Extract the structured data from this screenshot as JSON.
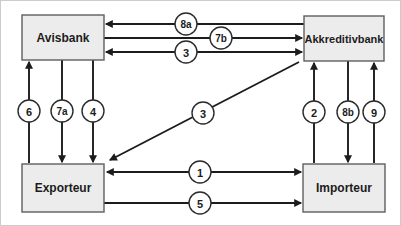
{
  "diagram": {
    "nodes": {
      "avisbank": {
        "label": "Avisbank"
      },
      "akkreditivbank": {
        "label": "Akkreditivbank"
      },
      "exporteur": {
        "label": "Exporteur"
      },
      "importeur": {
        "label": "Importeur"
      }
    },
    "edges": {
      "e8a": {
        "label": "8a",
        "from": "Akkreditivbank",
        "to": "Avisbank",
        "bidirectional": false
      },
      "e7b": {
        "label": "7b",
        "from": "Avisbank",
        "to": "Akkreditivbank",
        "bidirectional": false
      },
      "e3h": {
        "label": "3",
        "from": "Akkreditivbank",
        "to": "Avisbank",
        "bidirectional": true
      },
      "e6": {
        "label": "6",
        "from": "Exporteur",
        "to": "Avisbank",
        "bidirectional": false
      },
      "e7a": {
        "label": "7a",
        "from": "Avisbank",
        "to": "Exporteur",
        "bidirectional": false
      },
      "e4": {
        "label": "4",
        "from": "Avisbank",
        "to": "Exporteur",
        "bidirectional": false
      },
      "e3d": {
        "label": "3",
        "from": "Akkreditivbank",
        "to": "Exporteur",
        "bidirectional": false
      },
      "e2": {
        "label": "2",
        "from": "Importeur",
        "to": "Akkreditivbank",
        "bidirectional": false
      },
      "e8b": {
        "label": "8b",
        "from": "Akkreditivbank",
        "to": "Importeur",
        "bidirectional": false
      },
      "e9": {
        "label": "9",
        "from": "Importeur",
        "to": "Akkreditivbank",
        "bidirectional": false
      },
      "e1": {
        "label": "1",
        "from": "Exporteur",
        "to": "Importeur",
        "bidirectional": true
      },
      "e5": {
        "label": "5",
        "from": "Exporteur",
        "to": "Importeur",
        "bidirectional": false
      }
    },
    "colors": {
      "background": "#ffffff",
      "box_fill": "#ececec",
      "box_border": "#5f5f5f",
      "arrow": "#1c1c1c",
      "badge_fill": "#ffffff",
      "badge_border": "#2b2b2b",
      "label_text": "#1c1c1c",
      "frame": "#cccccc"
    }
  }
}
